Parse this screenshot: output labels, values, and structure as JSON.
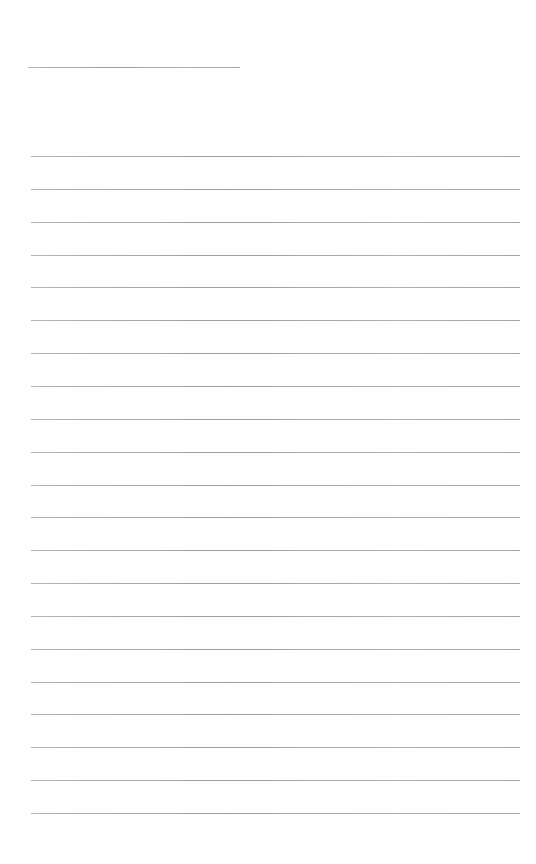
{
  "document": {
    "type": "lined-paper",
    "header_line": {
      "x": 28,
      "y": 67,
      "width": 212
    },
    "ruled_lines": {
      "count": 21,
      "x_start": 31,
      "x_end": 520,
      "first_y": 156,
      "spacing": 32.85
    },
    "line_color": "#a8a8a8",
    "background_color": "#fefefe"
  }
}
